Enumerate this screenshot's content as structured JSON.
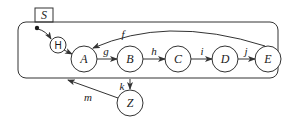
{
  "diagram": {
    "type": "statechart",
    "superstate": {
      "label": "S"
    },
    "history": {
      "label": "H"
    },
    "states": [
      {
        "id": "A",
        "label": "A"
      },
      {
        "id": "B",
        "label": "B"
      },
      {
        "id": "C",
        "label": "C"
      },
      {
        "id": "D",
        "label": "D"
      },
      {
        "id": "E",
        "label": "E"
      },
      {
        "id": "Z",
        "label": "Z"
      }
    ],
    "transitions": [
      {
        "from": "initial",
        "to": "H",
        "label": ""
      },
      {
        "from": "H",
        "to": "A",
        "label": ""
      },
      {
        "from": "A",
        "to": "B",
        "label": "g"
      },
      {
        "from": "B",
        "to": "C",
        "label": "h"
      },
      {
        "from": "C",
        "to": "D",
        "label": "i"
      },
      {
        "from": "D",
        "to": "E",
        "label": "j"
      },
      {
        "from": "E",
        "to": "A",
        "label": "f"
      },
      {
        "from": "S",
        "to": "Z",
        "label": "k"
      },
      {
        "from": "Z",
        "to": "S",
        "label": "m"
      }
    ]
  },
  "colors": {
    "stroke": "#333333",
    "background": "#ffffff"
  }
}
